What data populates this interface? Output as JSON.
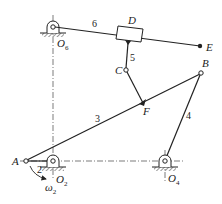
{
  "diagram": {
    "type": "planar linkage mechanism",
    "colors": {
      "line": "#222222",
      "centerline": "#444444",
      "background": "#ffffff"
    },
    "points": {
      "O6": {
        "label": "O",
        "sub": "6",
        "x": 53,
        "y": 27
      },
      "D": {
        "label": "D",
        "x": 130,
        "y": 33
      },
      "E": {
        "label": "E",
        "x": 200,
        "y": 46
      },
      "C": {
        "label": "C",
        "x": 126,
        "y": 70
      },
      "F": {
        "label": "F",
        "x": 143,
        "y": 103
      },
      "B": {
        "label": "B",
        "x": 201,
        "y": 73
      },
      "A": {
        "label": "A",
        "x": 26,
        "y": 161
      },
      "O2": {
        "label": "O",
        "sub": "2",
        "x": 53,
        "y": 161
      },
      "O4": {
        "label": "O",
        "sub": "4",
        "x": 165,
        "y": 161
      }
    },
    "links": [
      {
        "id": "2",
        "label": "2",
        "from": "A",
        "to": "O2"
      },
      {
        "id": "3",
        "label": "3",
        "from": "A",
        "to": "B"
      },
      {
        "id": "4",
        "label": "4",
        "from": "B",
        "to": "O4"
      },
      {
        "id": "5",
        "label": "5",
        "from": "D",
        "to": "C"
      },
      {
        "id": "6",
        "label": "6",
        "from": "O6",
        "to": "E"
      },
      {
        "id": "CF",
        "label": "",
        "from": "C",
        "to": "F"
      }
    ],
    "angular_velocity": {
      "symbol": "ω",
      "sub": "2"
    },
    "ground_pivots": [
      "O6",
      "O2",
      "O4"
    ]
  }
}
